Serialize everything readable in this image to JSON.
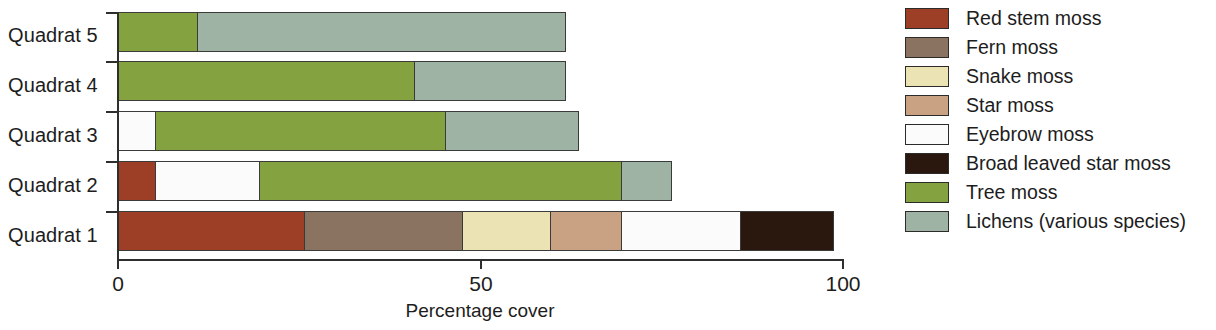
{
  "chart_data": {
    "type": "bar",
    "orientation": "horizontal",
    "stacked": true,
    "title": "",
    "xlabel": "Percentage cover",
    "ylabel": "",
    "xlim": [
      0,
      100
    ],
    "xticks": [
      0,
      50,
      100
    ],
    "xtick_labels": [
      "0",
      "50",
      "100"
    ],
    "grid": false,
    "legend_position": "right",
    "categories": [
      "Quadrat 1",
      "Quadrat 2",
      "Quadrat 3",
      "Quadrat 4",
      "Quadrat 5"
    ],
    "series": [
      {
        "name": "Red stem moss",
        "color": "#9c3f26",
        "values": [
          26,
          5.5,
          0,
          0,
          0
        ]
      },
      {
        "name": "Fern moss",
        "color": "#8a7360",
        "values": [
          22,
          0,
          0,
          0,
          0
        ]
      },
      {
        "name": "Snake moss",
        "color": "#ece3b4",
        "values": [
          12.4,
          0,
          0,
          0,
          0
        ]
      },
      {
        "name": "Star moss",
        "color": "#c9a183",
        "values": [
          10,
          0,
          0,
          0,
          0
        ]
      },
      {
        "name": "Eyebrow moss",
        "color": "#fbfbfb",
        "values": [
          16.6,
          14.5,
          5.4,
          0,
          0
        ]
      },
      {
        "name": "Broad leaved star moss",
        "color": "#2a180f",
        "values": [
          13,
          0,
          0,
          0,
          0
        ]
      },
      {
        "name": "Tree moss",
        "color": "#84a340",
        "values": [
          0,
          50.2,
          40.3,
          41.2,
          11.2
        ]
      },
      {
        "name": "Lichens (various species)",
        "color": "#9fb3a4",
        "values": [
          0,
          7.0,
          18.4,
          20.9,
          51.0
        ]
      }
    ],
    "totals": [
      100,
      77.2,
      64.1,
      62.1,
      62.2
    ]
  },
  "axis": {
    "x_title": "Percentage cover",
    "tick_0": "0",
    "tick_50": "50",
    "tick_100": "100"
  },
  "categories": {
    "q1": "Quadrat 1",
    "q2": "Quadrat 2",
    "q3": "Quadrat 3",
    "q4": "Quadrat 4",
    "q5": "Quadrat 5"
  },
  "legend": {
    "items": [
      {
        "label": "Red stem moss",
        "color": "#9c3f26"
      },
      {
        "label": "Fern moss",
        "color": "#8a7360"
      },
      {
        "label": "Snake moss",
        "color": "#ece3b4"
      },
      {
        "label": "Star moss",
        "color": "#c9a183"
      },
      {
        "label": "Eyebrow moss",
        "color": "#fbfbfb"
      },
      {
        "label": "Broad leaved star moss",
        "color": "#2a180f"
      },
      {
        "label": "Tree moss",
        "color": "#84a340"
      },
      {
        "label": "Lichens (various species)",
        "color": "#9fb3a4"
      }
    ]
  }
}
